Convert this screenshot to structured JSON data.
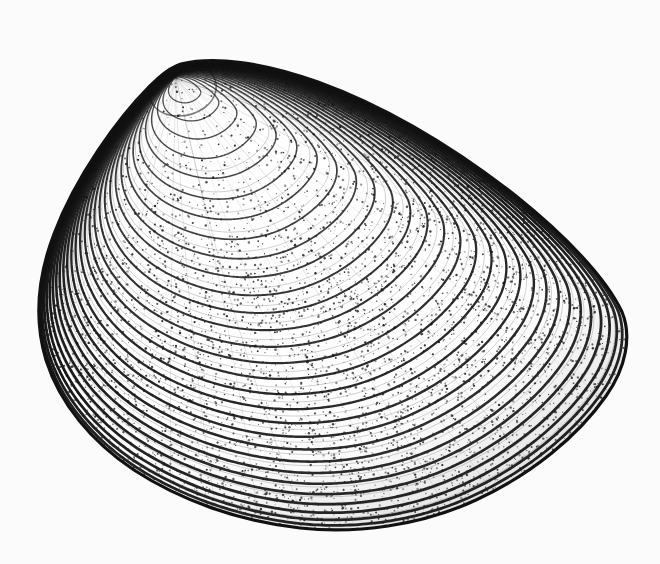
{
  "figure": {
    "kind": "scientific-line-illustration",
    "technique": "stipple-and-line-engraving",
    "view": "right-valve-exterior-lateral",
    "orientation": "umbo-upper-left-posterior-right",
    "caption": "",
    "title": "",
    "alt_text": "Black and white stipple drawing of a bivalve clam shell seen from the outside, with the beak at the upper left and many concentric growth lines sweeping toward the lower right margin."
  },
  "canvas": {
    "width": 660,
    "height": 564,
    "background_color": "#fbfbfb",
    "ink_color": "#111111",
    "stipple_color": "#2a2a2a"
  },
  "anatomy": {
    "parts": [
      {
        "name": "umbo",
        "label": "umbo (beak)",
        "x": 181,
        "y": 66
      },
      {
        "name": "dorsal-margin",
        "label": "dorsal margin",
        "x": 400,
        "y": 118
      },
      {
        "name": "posterior-margin",
        "label": "posterior margin",
        "x": 620,
        "y": 300
      },
      {
        "name": "ventral-margin",
        "label": "ventral margin",
        "x": 320,
        "y": 522
      },
      {
        "name": "anterior-margin",
        "label": "anterior margin",
        "x": 52,
        "y": 350
      },
      {
        "name": "lunule",
        "label": "lunule",
        "x": 128,
        "y": 150
      }
    ]
  },
  "outline": {
    "path": "M 181 64 C 214 56 262 62 318 82 C 384 106 452 146 516 196 C 566 236 606 278 622 312 C 632 336 626 368 606 396 C 578 436 532 474 476 500 C 420 526 356 534 300 528 C 238 521 180 500 134 470 C 92 442 60 404 46 360 C 34 320 38 276 54 234 C 76 176 118 118 150 86 C 162 74 171 67 181 64 Z",
    "stroke_width": 3.2
  },
  "growth_lines": {
    "count": 26,
    "description": "concentric growth increments expanding from the umbo toward the ventral and posterior margins",
    "focus_x": 176,
    "focus_y": 78,
    "scales": [
      0.055,
      0.095,
      0.135,
      0.178,
      0.222,
      0.268,
      0.313,
      0.357,
      0.4,
      0.441,
      0.481,
      0.52,
      0.558,
      0.595,
      0.631,
      0.666,
      0.7,
      0.733,
      0.764,
      0.794,
      0.822,
      0.849,
      0.874,
      0.898,
      0.921,
      0.943,
      0.962,
      0.978,
      0.99
    ],
    "stroke_color": "#121212"
  },
  "radial_striae": {
    "count": 34,
    "description": "fine radial striations crossing the growth lines, densest on the posterior-dorsal slope",
    "stroke_color": "#1d1d1d"
  },
  "stipple": {
    "dot_count": 5200,
    "dot_radius_min": 0.45,
    "dot_radius_max": 1.25,
    "density_note": "heavier along margins and growth-line crests, lighter in interspaces"
  },
  "chart_data": {
    "type": "scatter",
    "title": "",
    "xlabel": "",
    "ylabel": "",
    "categories": [],
    "values": []
  }
}
